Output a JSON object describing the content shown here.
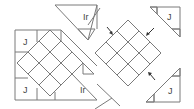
{
  "diagram": {
    "type": "quilt-block-assembly",
    "labels": {
      "j": "J",
      "ir": "Ir"
    },
    "colors": {
      "line": "#7a7a7a",
      "dark_fill": "#c4c4c4",
      "light_fill": "#ececec",
      "white_fill": "#ffffff",
      "arrow": "#333333"
    },
    "parts": [
      {
        "name": "left-assembled-block",
        "labels": [
          "J",
          "J",
          "Ir"
        ]
      },
      {
        "name": "top-setting-triangle",
        "labels": [
          "Ir"
        ]
      },
      {
        "name": "center-diamond-9-patch",
        "labels": []
      },
      {
        "name": "top-right-corner-triangle",
        "labels": [
          "J"
        ]
      },
      {
        "name": "bottom-right-corner-triangle",
        "labels": [
          "J"
        ]
      }
    ],
    "arrows": [
      "top-left-arrow",
      "top-right-arrow",
      "bottom-right-arrow"
    ]
  }
}
